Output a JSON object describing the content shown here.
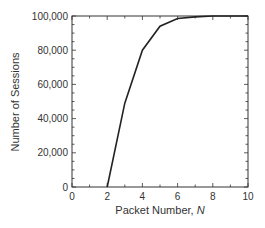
{
  "chart_data": {
    "type": "line",
    "title": "",
    "xlabel": "Packet Number, N",
    "xlabel_main": "Packet Number, ",
    "xlabel_var": "N",
    "ylabel": "Number of Sessions",
    "xlim": [
      0,
      10
    ],
    "ylim": [
      0,
      100000
    ],
    "grid": false,
    "legend": null,
    "x_ticks": [
      "0",
      "2",
      "4",
      "6",
      "8",
      "10"
    ],
    "y_ticks": [
      "0",
      "20,000",
      "40,000",
      "60,000",
      "80,000",
      "100,000"
    ],
    "series": [
      {
        "name": "Sessions",
        "x": [
          2,
          3,
          4,
          5,
          6,
          7,
          8,
          9,
          10
        ],
        "y": [
          0,
          49000,
          80000,
          94000,
          98500,
          99500,
          100000,
          100000,
          100000
        ]
      }
    ]
  }
}
